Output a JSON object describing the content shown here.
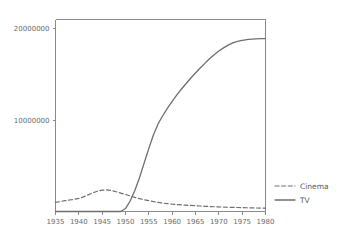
{
  "chart_data": {
    "type": "line",
    "title": "",
    "subtitle": "",
    "xlabel": "",
    "ylabel": "",
    "xlim": [
      1935,
      1980
    ],
    "ylim": [
      0,
      21000000
    ],
    "grid": false,
    "legend_position": "right-lower",
    "x_tick_labels": [
      "1935",
      "1940",
      "1945",
      "1950",
      "1955",
      "1960",
      "1965",
      "1970",
      "1975",
      "1980"
    ],
    "x_ticks": [
      1935,
      1940,
      1945,
      1950,
      1955,
      1960,
      1965,
      1970,
      1975,
      1980
    ],
    "y_tick_labels": [
      "10000000",
      "20000000"
    ],
    "y_ticks": [
      10000000,
      20000000
    ],
    "x": [
      1935,
      1936,
      1937,
      1938,
      1939,
      1940,
      1941,
      1942,
      1943,
      1944,
      1945,
      1946,
      1947,
      1948,
      1949,
      1950,
      1951,
      1952,
      1953,
      1954,
      1955,
      1956,
      1957,
      1958,
      1959,
      1960,
      1961,
      1962,
      1963,
      1964,
      1965,
      1966,
      1967,
      1968,
      1969,
      1970,
      1971,
      1972,
      1973,
      1974,
      1975,
      1976,
      1977,
      1978,
      1979,
      1980
    ],
    "series": [
      {
        "name": "Cinema",
        "style": "dashed",
        "color": "#6e6e6e",
        "values": [
          1000000,
          1080000,
          1180000,
          1260000,
          1330000,
          1430000,
          1600000,
          1820000,
          2050000,
          2220000,
          2330000,
          2360000,
          2290000,
          2160000,
          2010000,
          1860000,
          1700000,
          1540000,
          1400000,
          1290000,
          1180000,
          1080000,
          1000000,
          920000,
          860000,
          800000,
          760000,
          720000,
          690000,
          660000,
          630000,
          600000,
          570000,
          545000,
          520000,
          500000,
          480000,
          465000,
          450000,
          435000,
          420000,
          408000,
          396000,
          385000,
          375000,
          365000
        ]
      },
      {
        "name": "TV",
        "style": "solid",
        "color": "#6e6e6e",
        "values": [
          0,
          0,
          0,
          0,
          0,
          0,
          0,
          0,
          0,
          0,
          0,
          0,
          0,
          0,
          0,
          320000,
          1150000,
          2300000,
          3700000,
          5300000,
          6900000,
          8400000,
          9600000,
          10500000,
          11300000,
          12050000,
          12750000,
          13400000,
          14000000,
          14600000,
          15150000,
          15700000,
          16200000,
          16700000,
          17150000,
          17550000,
          17900000,
          18200000,
          18450000,
          18600000,
          18720000,
          18800000,
          18850000,
          18880000,
          18900000,
          18910000
        ]
      }
    ],
    "legend": [
      {
        "label": "Cinema",
        "style": "dashed",
        "color": "#6e6e6e"
      },
      {
        "label": "TV",
        "style": "solid",
        "color": "#6e6e6e"
      }
    ]
  },
  "style": {
    "background": "#ffffff",
    "axis_color": "#8a8a8a",
    "text_color": "#6b6b6b",
    "line_color": "#6e6e6e"
  }
}
